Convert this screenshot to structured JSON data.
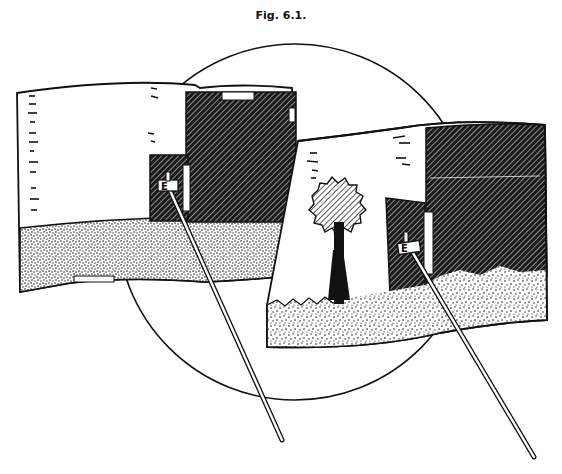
{
  "figure": {
    "caption": "Fig. 6.1.",
    "colors": {
      "ink": "#111111",
      "paper": "#ffffff"
    },
    "circle": {
      "cx": 295,
      "cy": 222,
      "r": 178
    },
    "left_panel": {
      "clip_label": "E",
      "elements": [
        "ruler-ticks",
        "dark-hatched-screen",
        "stippled-ground",
        "pole-with-clip"
      ]
    },
    "right_panel": {
      "clip_label": "E",
      "elements": [
        "ruler-ticks",
        "tree",
        "dark-hatched-screen",
        "stippled-ground",
        "pole-with-clip"
      ]
    }
  }
}
